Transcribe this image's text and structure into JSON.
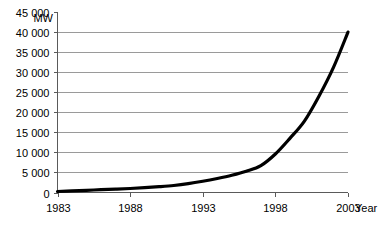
{
  "chart_data": {
    "type": "line",
    "title": "",
    "subtitle": "",
    "xlabel": "Year",
    "ylabel": "MW",
    "ylabel_position": "top-left-above-axis",
    "xlim": [
      1983,
      2003
    ],
    "ylim": [
      0,
      45000
    ],
    "ytick_step": 5000,
    "xtick_step": 5,
    "grid": true,
    "grid_axis": "y",
    "legend": false,
    "legend_position": "none",
    "x_tick_labels": [
      "1983",
      "1988",
      "1993",
      "1998",
      "2003"
    ],
    "x_tick_values": [
      1983,
      1988,
      1993,
      1998,
      2003
    ],
    "y_tick_labels": [
      "0",
      "5 000",
      "10 000",
      "15 000",
      "20 000",
      "25 000",
      "30 000",
      "35 000",
      "40 000",
      "45 000"
    ],
    "y_tick_values": [
      0,
      5000,
      10000,
      15000,
      20000,
      25000,
      30000,
      35000,
      40000,
      45000
    ],
    "series": [
      {
        "name": "Installed capacity",
        "x": [
          1983,
          1984,
          1985,
          1986,
          1987,
          1988,
          1989,
          1990,
          1991,
          1992,
          1993,
          1994,
          1995,
          1996,
          1997,
          1998,
          1999,
          2000,
          2001,
          2002,
          2003
        ],
        "values": [
          250,
          400,
          550,
          700,
          850,
          1000,
          1200,
          1450,
          1750,
          2200,
          2800,
          3500,
          4300,
          5300,
          6700,
          9600,
          13500,
          17800,
          24000,
          31200,
          40000
        ]
      }
    ],
    "curve_endpoint_value": 40000,
    "curve_start_value": 250,
    "line_color": "#000000",
    "gridline_color": "#9a9a9a",
    "axis_color": "#5a5a5a",
    "background_color": "#ffffff"
  },
  "axes": {
    "y_unit": "MW",
    "x_title": "Year"
  }
}
